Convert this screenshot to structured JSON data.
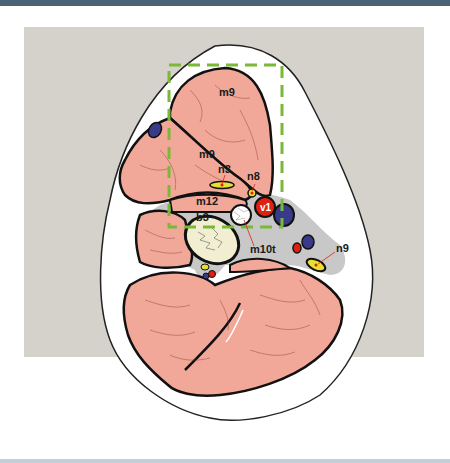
{
  "figure": {
    "type": "anatomical cross-section diagram",
    "colors": {
      "top_bar": "#4a6378",
      "panel_background": "#d4d2cb",
      "skin_outline_fill": "#ffffff",
      "muscle": "#f2a898",
      "fascia": "#c8c8c8",
      "bone": "#f2eed2",
      "nerve": "#e8e030",
      "artery": "#e02010",
      "vein": "#3a3a8a",
      "roi_box": "#7ab838",
      "leader_line": "#e02010"
    },
    "labels": {
      "m9_top": "m9",
      "m9_mid": "m9",
      "n3": "n3",
      "n8": "n8",
      "m12": "m12",
      "v1": "v1",
      "b3": "b3",
      "m10t": "m10t",
      "n9": "n9"
    },
    "roi_box": {
      "style": "dashed",
      "color": "#7ab838"
    }
  }
}
